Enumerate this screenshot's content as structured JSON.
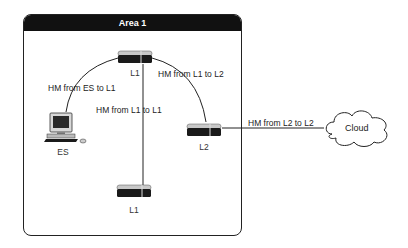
{
  "area": {
    "title": "Area 1"
  },
  "nodes": {
    "router_top": {
      "label": "L1",
      "type": "router",
      "level": "L1"
    },
    "router_bottom": {
      "label": "L1",
      "type": "router",
      "level": "L1"
    },
    "router_l2": {
      "label": "L2",
      "type": "router",
      "level": "L2"
    },
    "end_system": {
      "label": "ES",
      "type": "computer"
    },
    "cloud": {
      "label": "Cloud",
      "type": "cloud"
    }
  },
  "links": [
    {
      "from": "ES",
      "to": "L1 (top)",
      "label": "HM from ES to L1"
    },
    {
      "from": "L1 (top)",
      "to": "L1 (bottom)",
      "label": "HM from L1 to L1"
    },
    {
      "from": "L1 (top)",
      "to": "L2",
      "label": "HM from L1 to L2"
    },
    {
      "from": "L2",
      "to": "Cloud",
      "label": "HM from L2 to L2"
    }
  ],
  "colors": {
    "frame": "#222222",
    "header_bg": "#111111",
    "header_text": "#ffffff",
    "router_body": "#1a1a1a",
    "router_top": "#c8c8c8"
  }
}
